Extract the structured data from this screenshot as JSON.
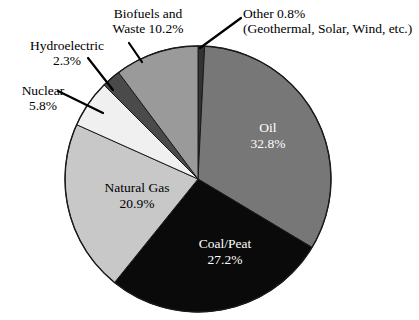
{
  "chart_data": {
    "type": "pie",
    "title": "",
    "subtitle": "",
    "xlabel": "",
    "ylabel": "",
    "legend_position": "none",
    "grid": false,
    "units": "percent",
    "total": 100.0,
    "start_angle_deg": 0,
    "direction": "clockwise",
    "categories": [
      "Other",
      "Oil",
      "Coal/Peat",
      "Natural Gas",
      "Nuclear",
      "Hydroelectric",
      "Biofuels and Waste"
    ],
    "values": [
      0.8,
      32.8,
      27.2,
      20.9,
      5.8,
      2.3,
      10.2
    ],
    "slices": [
      {
        "name": "Other",
        "label": "Other 0.8%",
        "label_line1": "Other 0.8%",
        "label_line2": "(Geothermal, Solar, Wind, etc.)",
        "note": "(Geothermal, Solar, Wind, etc.)",
        "percent": 0.8,
        "percent_text": "0.8%",
        "color": "#333333",
        "label_placement": "outside",
        "text_color": "#000000"
      },
      {
        "name": "Oil",
        "label": "Oil",
        "percent": 32.8,
        "percent_text": "32.8%",
        "color": "#777777",
        "label_placement": "inside",
        "text_color": "#ffffff"
      },
      {
        "name": "Coal/Peat",
        "label": "Coal/Peat",
        "percent": 27.2,
        "percent_text": "27.2%",
        "color": "#0a0a0a",
        "label_placement": "inside",
        "text_color": "#ffffff"
      },
      {
        "name": "Natural Gas",
        "label": "Natural Gas",
        "percent": 20.9,
        "percent_text": "20.9%",
        "color": "#c8c8c8",
        "label_placement": "inside",
        "text_color": "#000000"
      },
      {
        "name": "Nuclear",
        "label": "Nuclear",
        "label_line1": "Nuclear",
        "label_line2": "5.8%",
        "percent": 5.8,
        "percent_text": "5.8%",
        "color": "#f0f0f0",
        "label_placement": "outside",
        "text_color": "#000000"
      },
      {
        "name": "Hydroelectric",
        "label": "Hydroelectric",
        "label_line1": "Hydroelectric",
        "label_line2": "2.3%",
        "percent": 2.3,
        "percent_text": "2.3%",
        "color": "#4a4a4a",
        "label_placement": "outside",
        "text_color": "#000000"
      },
      {
        "name": "Biofuels and Waste",
        "label": "Biofuels and Waste",
        "label_line1": "Biofuels and",
        "label_line2": "Waste 10.2%",
        "percent": 10.2,
        "percent_text": "10.2%",
        "color": "#9a9a9a",
        "label_placement": "outside",
        "text_color": "#000000"
      }
    ]
  },
  "labels": {
    "biofuels": {
      "line1": "Biofuels and",
      "line2": "Waste 10.2%"
    },
    "other": {
      "line1": "Other 0.8%",
      "line2": "(Geothermal, Solar, Wind, etc.)"
    },
    "hydro": {
      "line1": "Hydroelectric",
      "line2": "2.3%"
    },
    "nuclear": {
      "line1": "Nuclear",
      "line2": "5.8%"
    },
    "oil": {
      "name": "Oil",
      "percent": "32.8%"
    },
    "coal": {
      "name": "Coal/Peat",
      "percent": "27.2%"
    },
    "gas": {
      "name": "Natural Gas",
      "percent": "20.9%"
    }
  },
  "style": {
    "background": "#ffffff",
    "outline": "#1a1a1a",
    "leader_line": "#000000"
  }
}
